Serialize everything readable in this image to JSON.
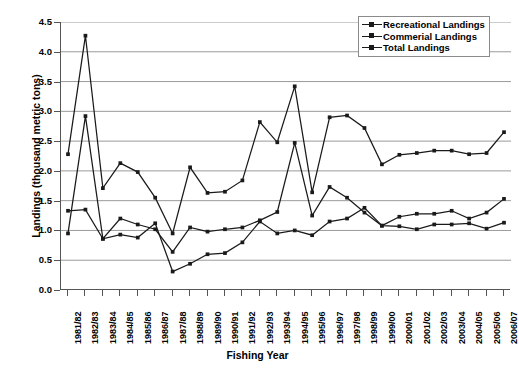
{
  "chart_data": {
    "type": "line",
    "title": "",
    "xlabel": "Fishing Year",
    "ylabel": "Landings (thousand metric tons)",
    "ylim": [
      0.0,
      4.5
    ],
    "ytick_labels": [
      "4.5",
      "4.0",
      "3.5",
      "3.0",
      "2.5",
      "2.0",
      "1.5",
      "1.0",
      "0.5",
      "0.0"
    ],
    "ytick_values": [
      4.5,
      4.0,
      3.5,
      3.0,
      2.5,
      2.0,
      1.5,
      1.0,
      0.5,
      0.0
    ],
    "grid": "horizontal",
    "legend_position": "top-right",
    "marker": "square",
    "line_color": "#1a1a1a",
    "categories": [
      "1981/82",
      "1982/83",
      "1983/84",
      "1984/85",
      "1985/86",
      "1986/87",
      "1987/88",
      "1988/89",
      "1989/90",
      "1990/91",
      "1991/92",
      "1992/93",
      "1993/94",
      "1994/95",
      "1995/96",
      "1996/97",
      "1997/98",
      "1998/99",
      "1999/00",
      "2000/01",
      "2001/02",
      "2002/03",
      "2003/04",
      "2004/05",
      "2005/06",
      "2006/07"
    ],
    "series": [
      {
        "name": "Recreational Landings",
        "values": [
          0.95,
          2.92,
          0.86,
          0.93,
          0.88,
          1.12,
          0.31,
          0.44,
          0.6,
          0.62,
          0.8,
          1.15,
          0.95,
          1.0,
          0.92,
          1.15,
          1.2,
          1.38,
          1.08,
          1.07,
          1.02,
          1.1,
          1.1,
          1.12,
          1.03,
          1.13
        ]
      },
      {
        "name": "Commerial Landings",
        "values": [
          1.33,
          1.35,
          0.86,
          1.2,
          1.1,
          1.02,
          0.64,
          1.05,
          0.98,
          1.02,
          1.05,
          1.17,
          1.31,
          2.47,
          1.25,
          1.73,
          1.55,
          1.3,
          1.08,
          1.23,
          1.28,
          1.28,
          1.33,
          1.2,
          1.3,
          1.53
        ]
      },
      {
        "name": "Total Landings",
        "values": [
          2.28,
          4.27,
          1.71,
          2.13,
          1.98,
          1.55,
          0.95,
          2.06,
          1.63,
          1.65,
          1.84,
          2.82,
          2.48,
          3.42,
          1.64,
          2.9,
          2.93,
          2.72,
          2.11,
          2.27,
          2.3,
          2.34,
          2.34,
          2.28,
          2.3,
          2.65
        ]
      }
    ]
  }
}
